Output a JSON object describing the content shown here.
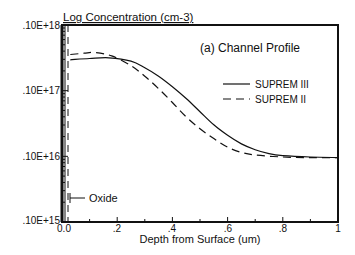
{
  "chart_data": {
    "type": "line",
    "title": "(a) Channel Profile",
    "xlabel": "Depth from Surface (um)",
    "ylabel": "Log Concentration (cm-3)",
    "xlim": [
      0,
      1
    ],
    "ylim_log10": [
      15,
      18
    ],
    "yscale": "log",
    "x_ticks": [
      "0.0",
      ".2",
      ".4",
      ".6",
      ".8",
      "1"
    ],
    "x_tick_values": [
      0,
      0.2,
      0.4,
      0.6,
      0.8,
      1.0
    ],
    "y_ticks": [
      ".10E+15",
      ".10E+16",
      ".10E+17",
      ".10E+18"
    ],
    "y_tick_values": [
      1000000000000000.0,
      1e+16,
      1e+17,
      1e+18
    ],
    "grid": false,
    "legend_position": "upper right",
    "annotations": [
      {
        "text": "Oxide",
        "x": 0.03,
        "y_log10": 15.3,
        "arrow": "points left to oxide region"
      }
    ],
    "series": [
      {
        "name": "SUPREM III",
        "style": "solid",
        "x": [
          0.03,
          0.1,
          0.17,
          0.25,
          0.3,
          0.35,
          0.4,
          0.45,
          0.5,
          0.55,
          0.6,
          0.65,
          0.7,
          0.75,
          0.8,
          0.9,
          1.0
        ],
        "y_log10": [
          17.47,
          17.49,
          17.5,
          17.45,
          17.35,
          17.22,
          17.06,
          16.88,
          16.68,
          16.48,
          16.32,
          16.19,
          16.1,
          16.04,
          16.01,
          15.99,
          15.98
        ]
      },
      {
        "name": "SUPREM II",
        "style": "dashed",
        "x": [
          0.03,
          0.08,
          0.12,
          0.18,
          0.25,
          0.3,
          0.35,
          0.4,
          0.45,
          0.5,
          0.55,
          0.6,
          0.65,
          0.7,
          0.8,
          0.9,
          1.0
        ],
        "y_log10": [
          17.55,
          17.57,
          17.58,
          17.53,
          17.38,
          17.22,
          17.03,
          16.82,
          16.6,
          16.42,
          16.27,
          16.14,
          16.06,
          16.02,
          15.99,
          15.98,
          15.98
        ]
      },
      {
        "name": "Oxide boundary",
        "style": "dashed-vertical",
        "x": [
          0.02,
          0.02
        ],
        "y_log10": [
          15,
          18
        ]
      }
    ]
  },
  "labels": {
    "ylabel": "Log Concentration (cm-3)",
    "title": "(a) Channel Profile",
    "xlabel": "Depth from Surface (um)",
    "legend_solid": "SUPREM III",
    "legend_dashed": "SUPREM II",
    "oxide": "Oxide",
    "y18": ".10E+18",
    "y17": ".10E+17",
    "y16": ".10E+16",
    "y15": ".10E+15",
    "x0": "0.0",
    "x2": ".2",
    "x4": ".4",
    "x6": ".6",
    "x8": ".8",
    "x10": "1"
  }
}
